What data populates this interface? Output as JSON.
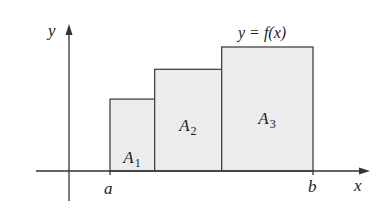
{
  "diagram": {
    "axes": {
      "x_label": "x",
      "y_label": "y"
    },
    "curve_label": "y = f(x)",
    "interval": {
      "start_label": "a",
      "end_label": "b"
    },
    "regions": [
      {
        "name": "A",
        "subscript": "1",
        "relative_height": 0.58,
        "relative_width": 0.22
      },
      {
        "name": "A",
        "subscript": "2",
        "relative_height": 0.82,
        "relative_width": 0.33
      },
      {
        "name": "A",
        "subscript": "3",
        "relative_height": 1.0,
        "relative_width": 0.45
      }
    ],
    "colors": {
      "region_fill": "#ececec",
      "line": "#333333",
      "text": "#222222"
    }
  }
}
